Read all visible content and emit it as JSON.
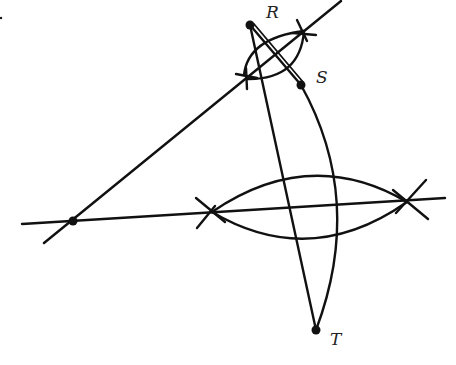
{
  "figure": {
    "points": {
      "R": {
        "label": "R",
        "x": 250,
        "y": 25
      },
      "S": {
        "label": "S",
        "x": 301,
        "y": 85
      },
      "T": {
        "label": "T",
        "x": 316,
        "y": 330
      },
      "P": {
        "label": "",
        "x": 73,
        "y": 221
      }
    },
    "labels": {
      "R": "R",
      "S": "S",
      "T": "T"
    },
    "stroke_color": "#111111",
    "background": "#ffffff"
  }
}
